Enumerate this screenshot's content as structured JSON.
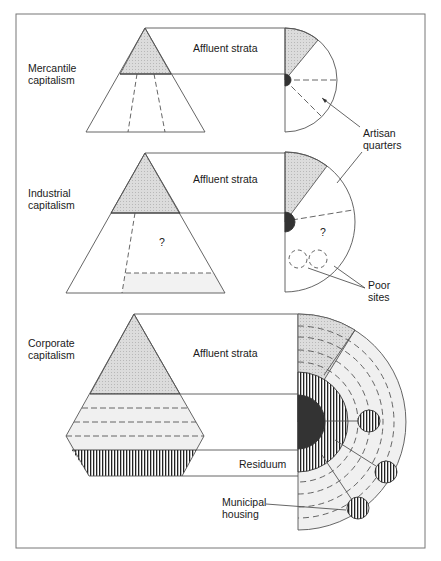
{
  "figure": {
    "panels": [
      {
        "id": "mercantile",
        "label_line1": "Mercantile",
        "label_line2": "capitalism",
        "strata_label": "Affluent strata",
        "annotation_line1": "Artisan",
        "annotation_line2": "quarters"
      },
      {
        "id": "industrial",
        "label_line1": "Industrial",
        "label_line2": "capitalism",
        "strata_label": "Affluent strata",
        "unknown_marker": "?",
        "unknown_marker_sector": "?",
        "annotation_line1": "Poor",
        "annotation_line2": "sites"
      },
      {
        "id": "corporate",
        "label_line1": "Corporate",
        "label_line2": "capitalism",
        "strata_label": "Affluent strata",
        "residuum_label": "Residuum",
        "annotation_line1": "Municipal",
        "annotation_line2": "housing"
      }
    ],
    "colors": {
      "line": "#555555",
      "affluent_fill": "#d6d6d6",
      "core_fill": "#333333",
      "light_fill": "#efefef",
      "frame": "#777777"
    }
  }
}
